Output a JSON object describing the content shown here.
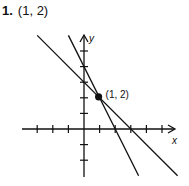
{
  "problem": {
    "number": "1.",
    "answer": "(1, 2)"
  },
  "chart_data": {
    "type": "line",
    "title": "(1, 2)",
    "xlabel": "x",
    "ylabel": "y",
    "xlim": [
      -4,
      6
    ],
    "ylim": [
      -3,
      6
    ],
    "x_ticks": [
      -3,
      -2,
      -1,
      1,
      2,
      3,
      4,
      5
    ],
    "y_ticks": [
      -2,
      -1,
      1,
      2,
      3,
      4,
      5
    ],
    "grid": false,
    "series": [
      {
        "name": "y = -x + 3",
        "slope": -1,
        "intercept": 3,
        "x": [
          -3,
          6
        ],
        "y": [
          6,
          -3
        ]
      },
      {
        "name": "y = -2x + 4",
        "slope": -2,
        "intercept": 4,
        "x": [
          -1,
          3.5
        ],
        "y": [
          6,
          -3
        ]
      }
    ],
    "points": [
      {
        "x": 1,
        "y": 2,
        "label": "(1, 2)"
      }
    ]
  },
  "colors": {
    "ink": "#111111"
  }
}
